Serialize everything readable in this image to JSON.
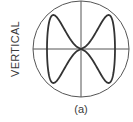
{
  "diagram": {
    "type": "lissajous-figure",
    "axis_label": "VERTICAL",
    "caption": "(a)",
    "screen": {
      "shape": "circle",
      "center": [
        81,
        49
      ],
      "radius": 48,
      "crosshair": true
    },
    "trace": {
      "description": "figure-eight with two lobes left and right crossing at center",
      "frequency_ratio": "1:2",
      "amplitude_x": 34,
      "amplitude_y": 34
    },
    "colors": {
      "line": "#4a4a4a",
      "trace": "#333333",
      "text": "#3a3a3a",
      "background": "#ffffff"
    }
  }
}
